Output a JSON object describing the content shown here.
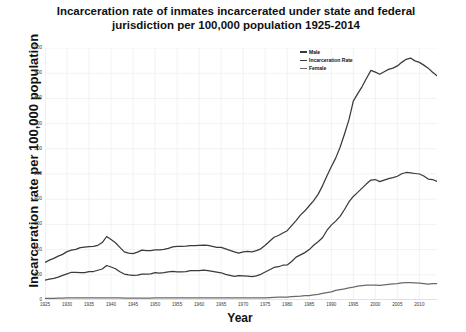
{
  "chart_data": {
    "type": "line",
    "title": "Incarceration rate of inmates incarcerated under state and federal jurisdiction per 100,000 population 1925-2014",
    "title_line1": "Incarceration rate of inmates incarcerated under state and federal",
    "title_line2": "jurisdiction per 100,000 population 1925-2014",
    "xlabel": "Year",
    "ylabel": "Incarceration rate per 100,000 population",
    "xlim": [
      1925,
      2014
    ],
    "ylim": [
      0,
      1000
    ],
    "grid": true,
    "legend_position": "top-right",
    "yticks": [
      0,
      100,
      200,
      300,
      400,
      500,
      600,
      700,
      800,
      900,
      1000
    ],
    "xticks": [
      1925,
      1930,
      1935,
      1940,
      1945,
      1950,
      1955,
      1960,
      1965,
      1970,
      1975,
      1980,
      1985,
      1990,
      1995,
      2000,
      2005,
      2010
    ],
    "x": [
      1925,
      1926,
      1927,
      1928,
      1929,
      1930,
      1931,
      1932,
      1933,
      1934,
      1935,
      1936,
      1937,
      1938,
      1939,
      1940,
      1941,
      1942,
      1943,
      1944,
      1945,
      1946,
      1947,
      1948,
      1949,
      1950,
      1951,
      1952,
      1953,
      1954,
      1955,
      1956,
      1957,
      1958,
      1959,
      1960,
      1961,
      1962,
      1963,
      1964,
      1965,
      1966,
      1967,
      1968,
      1969,
      1970,
      1971,
      1972,
      1973,
      1974,
      1975,
      1976,
      1977,
      1978,
      1979,
      1980,
      1981,
      1982,
      1983,
      1984,
      1985,
      1986,
      1987,
      1988,
      1989,
      1990,
      1991,
      1992,
      1993,
      1994,
      1995,
      1996,
      1997,
      1998,
      1999,
      2000,
      2001,
      2002,
      2003,
      2004,
      2005,
      2006,
      2007,
      2008,
      2009,
      2010,
      2011,
      2012,
      2013,
      2014
    ],
    "series": [
      {
        "name": "Male",
        "color": "#3a3a3a",
        "values": [
          149,
          158,
          165,
          174,
          181,
          192,
          198,
          201,
          208,
          210,
          212,
          213,
          217,
          228,
          252,
          240,
          227,
          209,
          191,
          186,
          184,
          190,
          198,
          196,
          196,
          199,
          199,
          201,
          205,
          211,
          213,
          213,
          214,
          216,
          216,
          217,
          218,
          217,
          213,
          209,
          209,
          203,
          197,
          191,
          186,
          191,
          193,
          191,
          196,
          203,
          217,
          233,
          249,
          256,
          266,
          275,
          295,
          315,
          337,
          354,
          374,
          394,
          419,
          453,
          492,
          529,
          563,
          606,
          659,
          715,
          789,
          819,
          847,
          880,
          911,
          904,
          896,
          906,
          915,
          920,
          929,
          943,
          955,
          960,
          949,
          943,
          932,
          920,
          904,
          890
        ]
      },
      {
        "name": "Incarceration Rate",
        "color": "#3a3a3a",
        "values": [
          79,
          83,
          86,
          91,
          98,
          104,
          110,
          110,
          109,
          109,
          113,
          113,
          118,
          123,
          137,
          131,
          124,
          112,
          103,
          100,
          98,
          99,
          103,
          103,
          104,
          109,
          107,
          109,
          112,
          114,
          112,
          112,
          113,
          117,
          117,
          117,
          119,
          117,
          114,
          111,
          108,
          102,
          98,
          94,
          97,
          96,
          95,
          93,
          96,
          102,
          111,
          120,
          129,
          132,
          138,
          139,
          153,
          170,
          179,
          188,
          200,
          217,
          231,
          247,
          276,
          297,
          313,
          332,
          359,
          389,
          411,
          427,
          444,
          461,
          476,
          478,
          470,
          476,
          482,
          486,
          491,
          501,
          506,
          504,
          502,
          500,
          492,
          480,
          478,
          471
        ]
      },
      {
        "name": "Female",
        "color": "#6a6a6a",
        "values": [
          6,
          6,
          6,
          7,
          7,
          8,
          8,
          8,
          8,
          8,
          8,
          8,
          8,
          8,
          8,
          8,
          8,
          8,
          7,
          7,
          7,
          7,
          7,
          7,
          7,
          8,
          8,
          8,
          8,
          8,
          8,
          8,
          8,
          8,
          8,
          8,
          8,
          8,
          8,
          8,
          8,
          8,
          8,
          8,
          8,
          8,
          8,
          8,
          8,
          8,
          8,
          9,
          10,
          11,
          11,
          11,
          13,
          14,
          15,
          17,
          17,
          20,
          22,
          26,
          29,
          32,
          38,
          41,
          44,
          48,
          51,
          55,
          57,
          59,
          59,
          59,
          58,
          60,
          62,
          64,
          65,
          68,
          69,
          69,
          68,
          67,
          65,
          63,
          65,
          65
        ]
      }
    ]
  }
}
